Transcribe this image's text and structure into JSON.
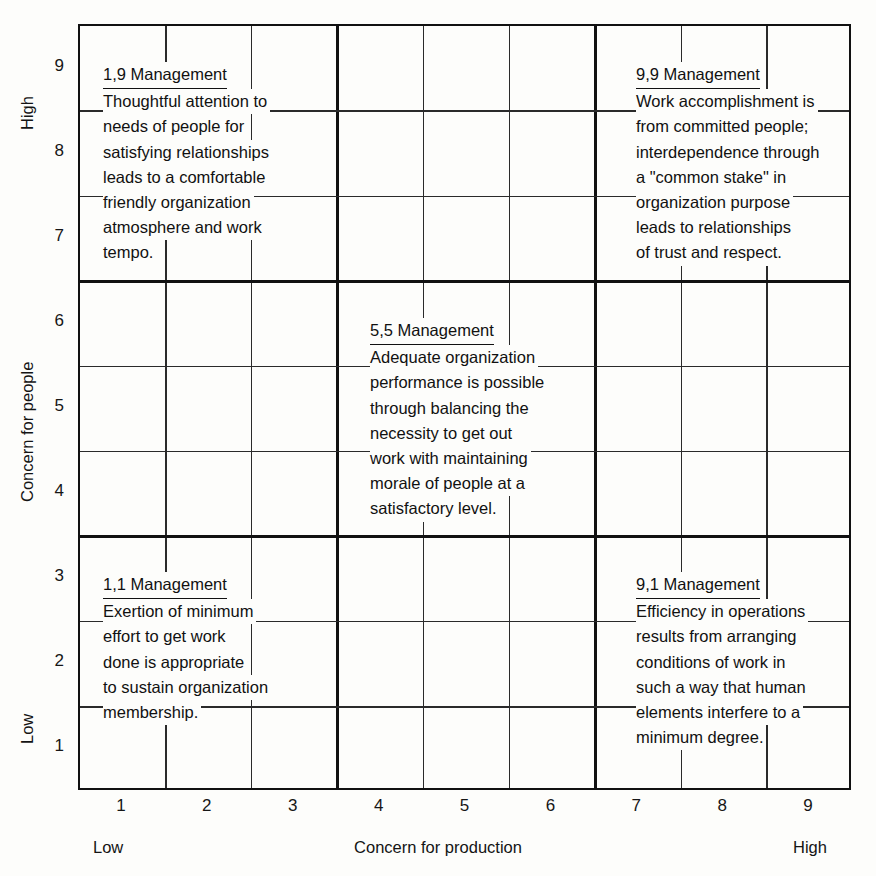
{
  "figure": {
    "name": "Managerial Grid",
    "background_color": "#fdfdfb",
    "line_color": "#111111"
  },
  "axes": {
    "x": {
      "title": "Concern for production",
      "low_label": "Low",
      "high_label": "High",
      "ticks": [
        "1",
        "2",
        "3",
        "4",
        "5",
        "6",
        "7",
        "8",
        "9"
      ]
    },
    "y": {
      "title": "Concern for people",
      "low_label": "Low",
      "high_label": "High",
      "ticks": [
        "9",
        "8",
        "7",
        "6",
        "5",
        "4",
        "3",
        "2",
        "1"
      ]
    }
  },
  "chart_data": {
    "type": "scatter",
    "title": "",
    "xlabel": "Concern for production",
    "ylabel": "Concern for people",
    "xlim": [
      0,
      9
    ],
    "ylim": [
      0,
      9
    ],
    "grid": true,
    "legend": "none",
    "x_ticks": [
      1,
      2,
      3,
      4,
      5,
      6,
      7,
      8,
      9
    ],
    "y_ticks": [
      1,
      2,
      3,
      4,
      5,
      6,
      7,
      8,
      9
    ],
    "major_gridlines_x": [
      3,
      6
    ],
    "major_gridlines_y": [
      3,
      6
    ],
    "annotations": [
      {
        "label": "1,9 Management",
        "x": 1,
        "y": 9,
        "text": "Thoughtful attention to needs of people for satisfying relationships leads to a comfortable friendly organization atmosphere and work tempo."
      },
      {
        "label": "9,9 Management",
        "x": 9,
        "y": 9,
        "text": "Work accomplishment is from committed people; interdependence through a \"common stake\" in organization purpose leads to relationships of trust and respect."
      },
      {
        "label": "5,5 Management",
        "x": 5,
        "y": 5,
        "text": "Adequate organization performance is possible through balancing the necessity to get out work with maintaining morale of people at a satisfactory level."
      },
      {
        "label": "1,1 Management",
        "x": 1,
        "y": 1,
        "text": "Exertion of minimum effort to get work done is appropriate to sustain organization membership."
      },
      {
        "label": "9,1 Management",
        "x": 9,
        "y": 1,
        "text": "Efficiency in operations results from arranging conditions of work in such a way that human elements interfere to a minimum degree."
      }
    ]
  },
  "blocks": {
    "b19": {
      "heading": "1,9 Management",
      "lines": [
        "Thoughtful attention to",
        "needs of people for",
        "satisfying relationships",
        "leads to a comfortable",
        "friendly organization",
        "atmosphere and work",
        "tempo."
      ]
    },
    "b99": {
      "heading": "9,9 Management",
      "lines": [
        "Work accomplishment is",
        "from committed people;",
        "interdependence through",
        "a \"common stake\" in",
        "organization purpose",
        "leads to relationships",
        "of trust and respect."
      ]
    },
    "b55": {
      "heading": "5,5 Management",
      "lines": [
        "Adequate organization",
        "performance is possible",
        "through balancing the",
        "necessity to get out",
        "work with maintaining",
        "morale of people at a",
        "satisfactory level."
      ]
    },
    "b11": {
      "heading": "1,1 Management",
      "lines": [
        "Exertion of minimum",
        "effort to get work",
        "done is appropriate",
        "to sustain organization",
        "membership."
      ]
    },
    "b91": {
      "heading": "9,1 Management",
      "lines": [
        "Efficiency in operations",
        "results from arranging",
        "conditions of work in",
        "such a way that human",
        "elements interfere to a",
        "minimum degree."
      ]
    }
  }
}
